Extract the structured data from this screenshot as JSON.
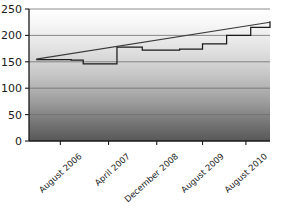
{
  "chart_data": {
    "type": "line",
    "title": "",
    "xlabel": "",
    "ylabel": "",
    "grid": true,
    "legend": "none",
    "ylim": [
      0,
      250
    ],
    "yticks": [
      0,
      50,
      100,
      150,
      200,
      250
    ],
    "ytick_labels": [
      "0",
      "50",
      "100",
      "150",
      "200",
      "250"
    ],
    "xtick_labels": [
      "August 2006",
      "April 2007",
      "December 2008",
      "August 2009",
      "August 2010"
    ],
    "xtick_positions": [
      0.13,
      0.33,
      0.53,
      0.72,
      0.9
    ],
    "xlim": [
      0,
      1
    ],
    "series": [
      {
        "name": "step",
        "style": "step-post",
        "x": [
          0.03,
          0.13,
          0.175,
          0.225,
          0.275,
          0.33,
          0.365,
          0.42,
          0.47,
          0.52,
          0.575,
          0.625,
          0.675,
          0.72,
          0.77,
          0.82,
          0.87,
          0.92,
          1.0
        ],
        "values": [
          154,
          154,
          153,
          146,
          146,
          146,
          178,
          178,
          172,
          172,
          172,
          174,
          174,
          184,
          184,
          200,
          200,
          215,
          227
        ]
      },
      {
        "name": "trend",
        "style": "line",
        "x": [
          0.03,
          1.0
        ],
        "values": [
          155,
          225
        ]
      }
    ],
    "background": {
      "gradient_top": "#fefefe",
      "gradient_bottom": "#5a5a5a"
    },
    "colors": {
      "step_line": "#1a1a1a",
      "trend_line": "#3a3a3a",
      "gridline": "#6e6e6e",
      "axis": "#1a1a1a",
      "text": "#1a1a1a"
    }
  }
}
